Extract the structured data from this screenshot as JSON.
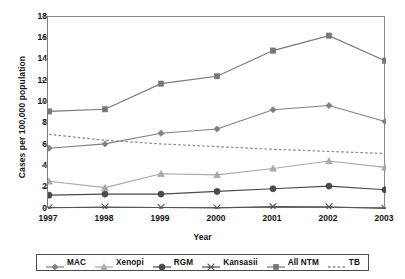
{
  "chart_data": {
    "type": "line",
    "title": "",
    "xlabel": "Year",
    "ylabel": "Cases per 100,000 population",
    "categories": [
      "1997",
      "1998",
      "1999",
      "2000",
      "2001",
      "2002",
      "2003"
    ],
    "x": [
      1997,
      1998,
      1999,
      2000,
      2001,
      2002,
      2003
    ],
    "ylim": [
      0,
      18
    ],
    "ytick_labels": [
      "0",
      "2",
      "4",
      "6",
      "8",
      "10",
      "12",
      "14",
      "16",
      "18"
    ],
    "yticks": [
      0,
      2,
      4,
      6,
      8,
      10,
      12,
      14,
      16,
      18
    ],
    "grid": false,
    "legend_position": "bottom",
    "series": [
      {
        "name": "MAC",
        "marker": "diamond",
        "color": "#808080",
        "linestyle": "solid",
        "values": [
          5.7,
          6.1,
          7.1,
          7.5,
          9.3,
          9.7,
          8.2
        ]
      },
      {
        "name": "Xenopi",
        "marker": "triangle",
        "color": "#a8a8a8",
        "linestyle": "solid",
        "values": [
          2.6,
          2.0,
          3.3,
          3.2,
          3.8,
          4.5,
          3.9
        ]
      },
      {
        "name": "RGM",
        "marker": "circle",
        "color": "#4a4a4a",
        "linestyle": "solid",
        "values": [
          1.3,
          1.4,
          1.4,
          1.65,
          1.9,
          2.15,
          1.8
        ]
      },
      {
        "name": "Kansasii",
        "marker": "star",
        "color": "#555555",
        "linestyle": "solid",
        "values": [
          0.12,
          0.18,
          0.14,
          0.1,
          0.22,
          0.2,
          0.05
        ]
      },
      {
        "name": "All NTM",
        "marker": "square",
        "color": "#777777",
        "linestyle": "solid",
        "values": [
          9.15,
          9.35,
          11.75,
          12.45,
          14.85,
          16.25,
          13.9
        ]
      },
      {
        "name": "TB",
        "marker": "none",
        "color": "#888888",
        "linestyle": "dotted",
        "values": [
          7.0,
          6.45,
          6.1,
          5.85,
          5.6,
          5.4,
          5.2
        ]
      }
    ]
  },
  "legend": {
    "items": [
      {
        "label": "MAC",
        "marker": "diamond-marker-icon"
      },
      {
        "label": "Xenopi",
        "marker": "triangle-marker-icon"
      },
      {
        "label": "RGM",
        "marker": "circle-marker-icon"
      },
      {
        "label": "Kansasii",
        "marker": "star-marker-icon"
      },
      {
        "label": "All NTM",
        "marker": "square-marker-icon"
      },
      {
        "label": "TB",
        "marker": "dotted-line-icon"
      }
    ]
  }
}
